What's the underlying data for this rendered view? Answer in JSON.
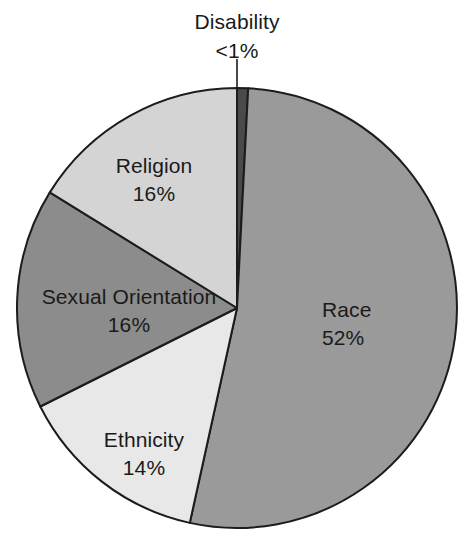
{
  "chart_data": {
    "type": "pie",
    "title": "",
    "subtitle": "",
    "xlabel": "",
    "ylabel": "",
    "legend_position": "none",
    "grid": false,
    "start_angle_deg": 0,
    "direction": "clockwise",
    "categories": [
      "Disability",
      "Race",
      "Ethnicity",
      "Sexual Orientation",
      "Religion"
    ],
    "values": [
      0.8,
      52,
      14,
      16,
      16
    ],
    "value_labels": [
      "<1%",
      "52%",
      "14%",
      "16%",
      "16%"
    ],
    "slices": [
      {
        "label": "Disability",
        "value_label": "<1%",
        "value": 0.8,
        "color": "#4a4a4a",
        "callout": true
      },
      {
        "label": "Race",
        "value_label": "52%",
        "value": 52,
        "color": "#9a9a9a",
        "callout": false
      },
      {
        "label": "Ethnicity",
        "value_label": "14%",
        "value": 14,
        "color": "#e8e8e8",
        "callout": false
      },
      {
        "label": "Sexual Orientation",
        "value_label": "16%",
        "value": 16,
        "color": "#8c8c8c",
        "callout": false
      },
      {
        "label": "Religion",
        "value_label": "16%",
        "value": 16,
        "color": "#d4d4d4",
        "callout": false
      }
    ],
    "outline_color": "#1c1c1c",
    "background_color": "#ffffff"
  },
  "labels": {
    "disability": {
      "name": "Disability",
      "value": "<1%"
    },
    "race": {
      "name": "Race",
      "value": "52%"
    },
    "ethnicity": {
      "name": "Ethnicity",
      "value": "14%"
    },
    "sexual_orientation": {
      "name": "Sexual Orientation",
      "value": "16%"
    },
    "religion": {
      "name": "Religion",
      "value": "16%"
    }
  }
}
